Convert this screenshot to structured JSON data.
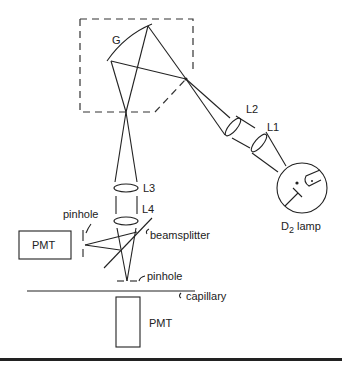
{
  "diagram": {
    "type": "optical-schematic",
    "components": {
      "grating": {
        "label": "G"
      },
      "lens_L1": {
        "label": "L1"
      },
      "lens_L2": {
        "label": "L2"
      },
      "lens_L3": {
        "label": "L3"
      },
      "lens_L4": {
        "label": "L4"
      },
      "lamp": {
        "label_main": "D",
        "label_sub": "2",
        "label_suffix": " lamp"
      },
      "beamsplitter": {
        "label": "beamsplitter"
      },
      "pinhole_side": {
        "label": "pinhole"
      },
      "pinhole_bottom": {
        "label": "pinhole"
      },
      "capillary": {
        "label": "capillary"
      },
      "pmt_side": {
        "label": "PMT"
      },
      "pmt_bottom": {
        "label": "PMT"
      }
    },
    "colors": {
      "line": "#222222",
      "background": "#ffffff"
    }
  }
}
